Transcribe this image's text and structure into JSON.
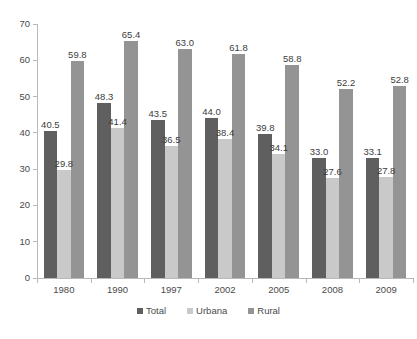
{
  "chart_data": {
    "type": "bar",
    "title": "",
    "subtitle": "",
    "xlabel": "",
    "ylabel": "",
    "ylim": [
      0,
      70
    ],
    "yticks": [
      0,
      10,
      20,
      30,
      40,
      50,
      60,
      70
    ],
    "ytick_labels": [
      "0",
      "10",
      "20",
      "30",
      "40",
      "50",
      "60",
      "70"
    ],
    "grid": false,
    "legend_position": "bottom",
    "categories": [
      "1980",
      "1990",
      "1997",
      "2002",
      "2005",
      "2008",
      "2009"
    ],
    "series": [
      {
        "name": "Total",
        "color": "#5f5f5f",
        "values": [
          40.5,
          48.3,
          43.5,
          44.0,
          39.8,
          33.0,
          33.1
        ],
        "labels": [
          "40.5",
          "48.3",
          "43.5",
          "44.0",
          "39.8",
          "33.0",
          "33.1"
        ]
      },
      {
        "name": "Urbana",
        "color": "#c9c9c9",
        "values": [
          29.8,
          41.4,
          36.5,
          38.4,
          34.1,
          27.6,
          27.8
        ],
        "labels": [
          "29.8",
          "41.4",
          "36.5",
          "38.4",
          "34.1",
          "27.6",
          "27.8"
        ]
      },
      {
        "name": "Rural",
        "color": "#949494",
        "values": [
          59.8,
          65.4,
          63.0,
          61.8,
          58.8,
          52.2,
          52.8
        ],
        "labels": [
          "59.8",
          "65.4",
          "63.0",
          "61.8",
          "58.8",
          "52.2",
          "52.8"
        ]
      }
    ]
  },
  "legend": {
    "items": [
      {
        "label": "Total",
        "color": "#5f5f5f"
      },
      {
        "label": "Urbana",
        "color": "#c9c9c9"
      },
      {
        "label": "Rural",
        "color": "#949494"
      }
    ]
  }
}
